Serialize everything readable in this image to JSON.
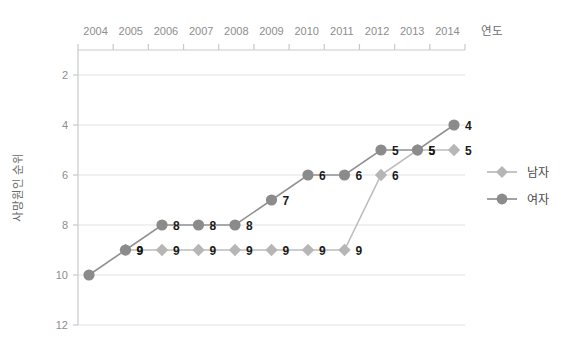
{
  "chart_data": {
    "type": "line",
    "title": "",
    "xlabel": "연도",
    "ylabel": "사망원인 순위",
    "categories": [
      "2004",
      "2005",
      "2006",
      "2007",
      "2008",
      "2009",
      "2010",
      "2011",
      "2012",
      "2013",
      "2014"
    ],
    "x": [
      2004,
      2005,
      2006,
      2007,
      2008,
      2009,
      2010,
      2011,
      2012,
      2013,
      2014
    ],
    "xlim": [
      2003.5,
      2014.5
    ],
    "ylim": [
      1,
      12
    ],
    "y_inverted": true,
    "y_ticks": [
      2,
      4,
      6,
      8,
      10,
      12
    ],
    "grid": "horizontal",
    "legend_position": "right",
    "series": [
      {
        "name": "남자",
        "marker": "diamond",
        "color": "#b6b6b6",
        "line_color": "#bdbdbd",
        "values": [
          null,
          9,
          9,
          9,
          9,
          9,
          9,
          9,
          6,
          5,
          5
        ],
        "labels": [
          "",
          "9",
          "9",
          "9",
          "9",
          "9",
          "9",
          "9",
          "6",
          "5",
          "5"
        ]
      },
      {
        "name": "여자",
        "marker": "circle",
        "color": "#8b8b8b",
        "line_color": "#919191",
        "values": [
          10,
          9,
          8,
          8,
          8,
          7,
          6,
          6,
          5,
          5,
          4
        ],
        "labels": [
          "",
          "9",
          "8",
          "8",
          "8",
          "7",
          "6",
          "6",
          "5",
          "5",
          "4"
        ]
      }
    ]
  },
  "axes": {
    "x_tick_labels": [
      "2004",
      "2005",
      "2006",
      "2007",
      "2008",
      "2009",
      "2010",
      "2011",
      "2012",
      "2013",
      "2014"
    ],
    "y_tick_labels": [
      "2",
      "4",
      "6",
      "8",
      "10",
      "12"
    ],
    "x_axis_title": "연도",
    "y_axis_title": "사망원인 순위"
  },
  "legend": {
    "items": [
      {
        "label": "남자",
        "marker": "diamond",
        "color": "#b6b6b6"
      },
      {
        "label": "여자",
        "marker": "circle",
        "color": "#8b8b8b"
      }
    ]
  },
  "colors": {
    "male": "#b6b6b6",
    "female": "#8b8b8b",
    "grid": "#e2e2e2",
    "axis": "#c9c9c9",
    "tick_text": "#8d8d8d",
    "label_text": "#1a1a1a"
  }
}
